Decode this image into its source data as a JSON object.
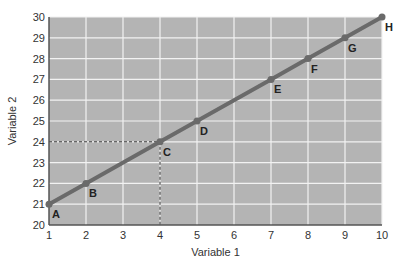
{
  "chart_data": {
    "type": "line",
    "title": "",
    "xlabel": "Variable 1",
    "ylabel": "Variable 2",
    "xlim": [
      1,
      10
    ],
    "ylim": [
      20,
      30
    ],
    "xticks": [
      1,
      2,
      3,
      4,
      5,
      6,
      7,
      8,
      9,
      10
    ],
    "yticks": [
      20,
      21,
      22,
      23,
      24,
      25,
      26,
      27,
      28,
      29,
      30
    ],
    "grid": true,
    "series": [
      {
        "name": "Variable 2 vs Variable 1",
        "points": [
          {
            "label": "A",
            "x": 1,
            "y": 21
          },
          {
            "label": "B",
            "x": 2,
            "y": 22
          },
          {
            "label": "C",
            "x": 4,
            "y": 24
          },
          {
            "label": "D",
            "x": 5,
            "y": 25
          },
          {
            "label": "E",
            "x": 7,
            "y": 27
          },
          {
            "label": "F",
            "x": 8,
            "y": 28
          },
          {
            "label": "G",
            "x": 9,
            "y": 29
          },
          {
            "label": "H",
            "x": 10,
            "y": 30
          }
        ]
      }
    ],
    "annotations": [
      {
        "type": "dashed-guide",
        "point": "C",
        "x": 4,
        "y": 24
      }
    ],
    "colors": {
      "plot_background": "#b4b4b4",
      "grid": "#f2f2f2",
      "line": "#6a6a6a",
      "guide": "#333333"
    }
  }
}
